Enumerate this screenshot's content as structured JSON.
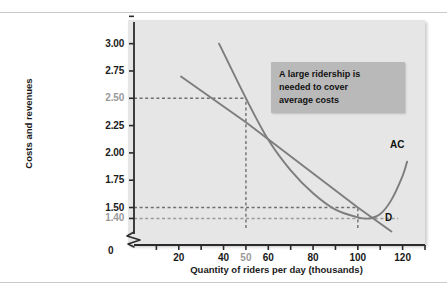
{
  "figure": {
    "panel_bg": "#e6e6e6",
    "curve_color": "#7d7d7d",
    "axis_color": "#2b2b2b",
    "muted_color": "#9a9a9a",
    "annotation_bg": "#b9b9b9"
  },
  "annotation": {
    "name": "callout-note",
    "lines": [
      "A large ridership is",
      "needed to cover",
      "average costs"
    ]
  },
  "chart_data": {
    "type": "line",
    "title": "",
    "xlabel": "Quantity of riders per day (thousands)",
    "ylabel": "Costs and revenues",
    "xlim": [
      0,
      130
    ],
    "ylim": [
      1.3125,
      3.125
    ],
    "grid": false,
    "legend": "inline-curve-labels",
    "origin_label": "0",
    "axis_break": true,
    "xticks": [
      10,
      20,
      30,
      40,
      50,
      60,
      70,
      80,
      90,
      100,
      110,
      120,
      130
    ],
    "xtick_labels": [
      {
        "value": 20,
        "text": "20",
        "muted": false
      },
      {
        "value": 40,
        "text": "40",
        "muted": false
      },
      {
        "value": 50,
        "text": "50",
        "muted": true
      },
      {
        "value": 60,
        "text": "60",
        "muted": false
      },
      {
        "value": 80,
        "text": "80",
        "muted": false
      },
      {
        "value": 100,
        "text": "100",
        "muted": false
      },
      {
        "value": 120,
        "text": "120",
        "muted": false
      }
    ],
    "yticks": [
      1.4,
      1.5,
      1.75,
      2.0,
      2.25,
      2.5,
      2.75,
      3.0,
      3.25
    ],
    "ytick_labels": [
      {
        "value": 3.0,
        "text": "3.00",
        "muted": false
      },
      {
        "value": 2.75,
        "text": "2.75",
        "muted": false
      },
      {
        "value": 2.5,
        "text": "2.50",
        "muted": true
      },
      {
        "value": 2.25,
        "text": "2.25",
        "muted": false
      },
      {
        "value": 2.0,
        "text": "2.00",
        "muted": false
      },
      {
        "value": 1.75,
        "text": "1.75",
        "muted": false
      },
      {
        "value": 1.5,
        "text": "1.50",
        "muted": false
      },
      {
        "value": 1.4,
        "text": "1.40",
        "muted": true
      }
    ],
    "series": [
      {
        "name": "AC",
        "label": "AC",
        "description": "Average cost curve, U-shaped, falling steeply then rising",
        "points": [
          {
            "x": 38,
            "y": 3.0
          },
          {
            "x": 50,
            "y": 2.5
          },
          {
            "x": 60,
            "y": 2.12
          },
          {
            "x": 70,
            "y": 1.84
          },
          {
            "x": 80,
            "y": 1.63
          },
          {
            "x": 90,
            "y": 1.48
          },
          {
            "x": 100,
            "y": 1.41
          },
          {
            "x": 105,
            "y": 1.4
          },
          {
            "x": 110,
            "y": 1.44
          },
          {
            "x": 115,
            "y": 1.57
          },
          {
            "x": 120,
            "y": 1.79
          },
          {
            "x": 122,
            "y": 1.92
          }
        ]
      },
      {
        "name": "D",
        "label": "D",
        "description": "Demand curve, downward sloping straight line",
        "points": [
          {
            "x": 21,
            "y": 2.7
          },
          {
            "x": 50,
            "y": 2.28
          },
          {
            "x": 100,
            "y": 1.5
          },
          {
            "x": 115,
            "y": 1.28
          }
        ]
      }
    ],
    "reference_lines": [
      {
        "name": "ac-at-50",
        "orientation": "horizontal",
        "y": 2.5,
        "from_x": 0,
        "to_x": 50,
        "muted": false
      },
      {
        "name": "quantity-50",
        "orientation": "vertical",
        "x": 50,
        "from_y": 1.3125,
        "to_y": 2.5,
        "muted": false
      },
      {
        "name": "price-150",
        "orientation": "horizontal",
        "y": 1.5,
        "from_x": 0,
        "to_x": 100,
        "muted": false
      },
      {
        "name": "ac-min-140",
        "orientation": "horizontal",
        "y": 1.4,
        "from_x": 0,
        "to_x": 118,
        "muted": true
      },
      {
        "name": "quantity-100",
        "orientation": "vertical",
        "x": 100,
        "from_y": 1.3125,
        "to_y": 1.5,
        "muted": false
      }
    ],
    "annotations": [
      {
        "name": "callout-note",
        "text": "A large ridership is needed to cover average costs",
        "x": 72,
        "y": 2.78
      }
    ]
  }
}
